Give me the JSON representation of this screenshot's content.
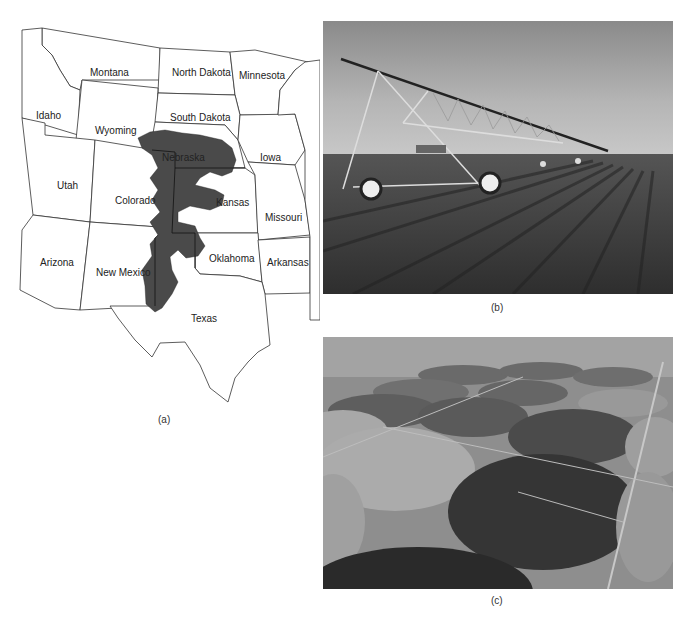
{
  "figure": {
    "panels": [
      {
        "id": "a",
        "type": "map",
        "caption": "(a)",
        "description": "Map of central/western United States with shaded aquifer region",
        "states": [
          {
            "name": "Montana",
            "x": 90,
            "y": 67
          },
          {
            "name": "North Dakota",
            "x": 172,
            "y": 67
          },
          {
            "name": "Minnesota",
            "x": 239,
            "y": 70
          },
          {
            "name": "Idaho",
            "x": 36,
            "y": 110
          },
          {
            "name": "South Dakota",
            "x": 170,
            "y": 112
          },
          {
            "name": "Wyoming",
            "x": 95,
            "y": 125
          },
          {
            "name": "Nebraska",
            "x": 162,
            "y": 152
          },
          {
            "name": "Iowa",
            "x": 260,
            "y": 152
          },
          {
            "name": "Utah",
            "x": 57,
            "y": 180
          },
          {
            "name": "Colorado",
            "x": 115,
            "y": 195
          },
          {
            "name": "Kansas",
            "x": 216,
            "y": 197
          },
          {
            "name": "Missouri",
            "x": 265,
            "y": 212
          },
          {
            "name": "Arizona",
            "x": 40,
            "y": 257
          },
          {
            "name": "New Mexico",
            "x": 96,
            "y": 267
          },
          {
            "name": "Oklahoma",
            "x": 209,
            "y": 253
          },
          {
            "name": "Arkansas",
            "x": 267,
            "y": 257
          },
          {
            "name": "Texas",
            "x": 191,
            "y": 313
          }
        ],
        "aquifer_color": "#4a4a4a"
      },
      {
        "id": "b",
        "type": "photo",
        "caption": "(b)",
        "description": "Center-pivot irrigation system over crop rows"
      },
      {
        "id": "c",
        "type": "photo",
        "caption": "(c)",
        "description": "Aerial view of circular center-pivot irrigated fields"
      }
    ]
  }
}
